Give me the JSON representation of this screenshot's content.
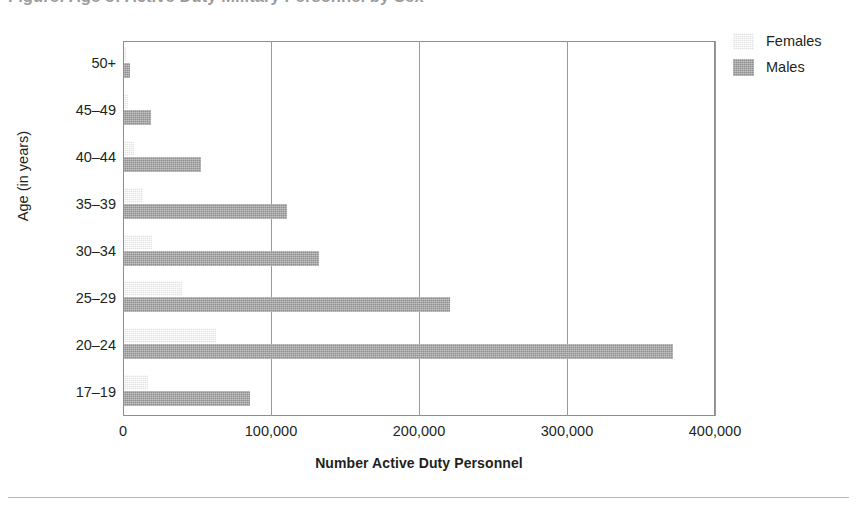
{
  "title": "Figure: Age of Active Duty Military Personnel by Sex",
  "axes": {
    "y_title": "Age (in years)",
    "x_title": "Number Active Duty Personnel",
    "x_ticks": [
      "0",
      "100,000",
      "200,000",
      "300,000",
      "400,000"
    ],
    "x_tick_values": [
      0,
      100000,
      200000,
      300000,
      400000
    ]
  },
  "legend": {
    "position": "top-right",
    "items": [
      {
        "label": "Females",
        "color": "#e2e2e2",
        "key": "females"
      },
      {
        "label": "Males",
        "color": "#8e8e8e",
        "key": "males"
      }
    ]
  },
  "chart_data": {
    "type": "bar",
    "orientation": "horizontal",
    "title": "Figure: Age of Active Duty Military Personnel by Sex",
    "xlabel": "Number Active Duty Personnel",
    "ylabel": "Age (in years)",
    "xlim": [
      0,
      400000
    ],
    "grid": "vertical-gridlines-at-x-ticks",
    "categories": [
      "50+",
      "45–49",
      "40–44",
      "35–39",
      "30–34",
      "25–29",
      "20–24",
      "17–19"
    ],
    "series": [
      {
        "name": "Females",
        "color": "#e2e2e2",
        "values": [
          1000,
          3000,
          7000,
          13000,
          19000,
          39000,
          62000,
          16000
        ]
      },
      {
        "name": "Males",
        "color": "#8e8e8e",
        "values": [
          4000,
          18000,
          52000,
          110000,
          132000,
          220000,
          371000,
          85000
        ]
      }
    ]
  }
}
